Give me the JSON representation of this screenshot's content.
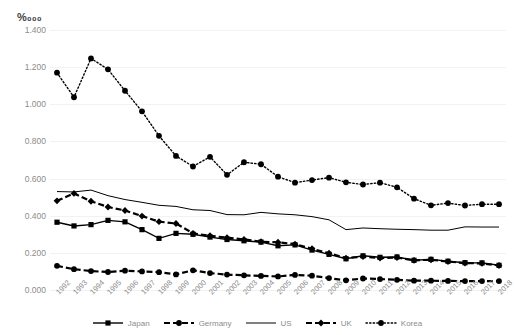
{
  "chart_data": {
    "type": "line",
    "title": "",
    "subtitle": "",
    "unit_label": "‰₀₀₀",
    "unit_label_display": "%₀₀₀",
    "xlabel": "",
    "ylabel": "",
    "ylim": [
      0.0,
      1.4
    ],
    "ytick_step": 0.2,
    "grid": true,
    "legend_position": "bottom",
    "ytick_labels": [
      "0.000",
      "0.200",
      "0.400",
      "0.600",
      "0.800",
      "1.000",
      "1.200",
      "1.400"
    ],
    "ytick_values": [
      0.0,
      0.2,
      0.4,
      0.6,
      0.8,
      1.0,
      1.2,
      1.4
    ],
    "categories": [
      "1992",
      "1993",
      "1994",
      "1995",
      "1996",
      "1997",
      "1998",
      "1999",
      "2000",
      "2001",
      "2002",
      "2003",
      "2004",
      "2005",
      "2006",
      "2007",
      "2008",
      "2009",
      "2010",
      "2011",
      "2012",
      "2013",
      "2014",
      "2015",
      "2016",
      "2017",
      "2018"
    ],
    "series": [
      {
        "name": "Japan",
        "style": "solid",
        "marker": "square",
        "color": "#000000",
        "values": [
          0.365,
          0.345,
          0.352,
          0.375,
          0.367,
          0.325,
          0.278,
          0.305,
          0.3,
          0.285,
          0.272,
          0.265,
          0.258,
          0.238,
          0.243,
          0.215,
          0.192,
          0.168,
          0.184,
          0.176,
          0.178,
          0.16,
          0.165,
          0.155,
          0.147,
          0.146,
          0.133
        ]
      },
      {
        "name": "Germany",
        "style": "dashed",
        "marker": "circle",
        "color": "#000000",
        "values": [
          0.13,
          0.112,
          0.102,
          0.097,
          0.104,
          0.1,
          0.096,
          0.084,
          0.106,
          0.091,
          0.083,
          0.079,
          0.076,
          0.073,
          0.081,
          0.077,
          0.064,
          0.052,
          0.062,
          0.059,
          0.055,
          0.05,
          0.05,
          0.049,
          0.048,
          0.048,
          0.048
        ]
      },
      {
        "name": "US",
        "style": "solid",
        "marker": "none",
        "color": "#000000",
        "values": [
          0.53,
          0.528,
          0.538,
          0.508,
          0.487,
          0.472,
          0.456,
          0.45,
          0.432,
          0.428,
          0.406,
          0.405,
          0.418,
          0.41,
          0.405,
          0.395,
          0.378,
          0.325,
          0.334,
          0.33,
          0.327,
          0.325,
          0.322,
          0.322,
          0.34,
          0.339,
          0.339
        ]
      },
      {
        "name": "UK",
        "style": "dashed",
        "marker": "diamond",
        "color": "#000000",
        "values": [
          0.48,
          0.52,
          0.478,
          0.447,
          0.428,
          0.398,
          0.368,
          0.358,
          0.305,
          0.292,
          0.282,
          0.272,
          0.26,
          0.257,
          0.247,
          0.222,
          0.198,
          0.172,
          0.18,
          0.172,
          0.175,
          0.16,
          0.163,
          0.153,
          0.145,
          0.143,
          0.132
        ]
      },
      {
        "name": "Korea",
        "style": "dotted",
        "marker": "circle",
        "color": "#000000",
        "values": [
          1.17,
          1.038,
          1.247,
          1.188,
          1.073,
          0.962,
          0.83,
          0.722,
          0.665,
          0.717,
          0.62,
          0.688,
          0.677,
          0.61,
          0.578,
          0.592,
          0.605,
          0.58,
          0.568,
          0.578,
          0.553,
          0.492,
          0.456,
          0.468,
          0.455,
          0.462,
          0.462
        ]
      }
    ]
  },
  "legend": {
    "items": [
      {
        "label": "Japan"
      },
      {
        "label": "Germany"
      },
      {
        "label": "US"
      },
      {
        "label": "UK"
      },
      {
        "label": "Korea"
      }
    ]
  }
}
